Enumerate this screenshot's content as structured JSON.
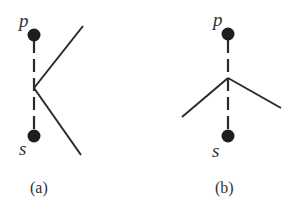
{
  "panels": [
    {
      "id": "a",
      "caption": "(a)",
      "nodes": [
        {
          "label": "p",
          "x": 34,
          "y": 35
        },
        {
          "label": "s",
          "x": 34,
          "y": 136
        }
      ],
      "junction": {
        "x": 34,
        "y": 88
      },
      "branches": [
        {
          "x": 83,
          "y": 26
        },
        {
          "x": 81,
          "y": 155
        }
      ]
    },
    {
      "id": "b",
      "caption": "(b)",
      "nodes": [
        {
          "label": "p",
          "x": 228,
          "y": 34
        },
        {
          "label": "s",
          "x": 228,
          "y": 136
        }
      ],
      "junction": {
        "x": 228,
        "y": 78
      },
      "branches": [
        {
          "x": 182,
          "y": 117
        },
        {
          "x": 281,
          "y": 108
        }
      ]
    }
  ],
  "colors": {
    "ink": "#2a2a2a",
    "node": "#1e1e1e",
    "background": "#ffffff"
  }
}
